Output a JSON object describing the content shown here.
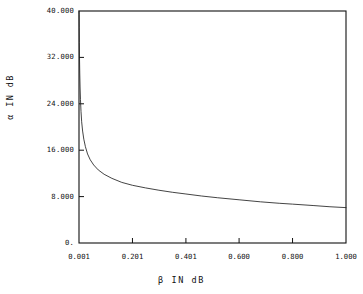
{
  "chart_data": {
    "type": "line",
    "title": "",
    "xlabel": "β  IN  dB",
    "ylabel": "α  IN  dB",
    "xlim": [
      0.001,
      1.0
    ],
    "ylim": [
      0.0,
      40.0
    ],
    "grid": false,
    "legend": null,
    "x_tick_labels": [
      "0.001",
      "0.201",
      "0.401",
      "0.600",
      "0.800",
      "1.000"
    ],
    "x_tick_values": [
      0.001,
      0.201,
      0.401,
      0.6,
      0.8,
      1.0
    ],
    "y_tick_labels": [
      "0.",
      "8.000",
      "16.000",
      "24.000",
      "32.000",
      "40.000"
    ],
    "y_tick_values": [
      0.0,
      8.0,
      16.0,
      24.0,
      32.0,
      40.0
    ],
    "series": [
      {
        "name": "alpha vs beta",
        "x": [
          0.001,
          0.0013,
          0.0017,
          0.0022,
          0.0029,
          0.0038,
          0.005,
          0.0065,
          0.0085,
          0.011,
          0.0145,
          0.019,
          0.025,
          0.033,
          0.043,
          0.056,
          0.073,
          0.095,
          0.124,
          0.161,
          0.201,
          0.25,
          0.3,
          0.35,
          0.401,
          0.46,
          0.52,
          0.6,
          0.68,
          0.75,
          0.8,
          0.88,
          0.94,
          1.0
        ],
        "y": [
          40.0,
          39.4,
          37.2,
          34.6,
          31.9,
          29.3,
          26.9,
          24.7,
          22.7,
          20.9,
          19.3,
          17.9,
          16.6,
          15.35,
          14.35,
          13.45,
          12.6,
          11.85,
          11.15,
          10.45,
          9.95,
          9.5,
          9.1,
          8.75,
          8.45,
          8.1,
          7.8,
          7.45,
          7.1,
          6.85,
          6.7,
          6.45,
          6.25,
          6.1
        ]
      }
    ],
    "plot_box_px": {
      "left": 79,
      "right": 346,
      "top": 11,
      "bottom": 243
    },
    "colors": {
      "line": "#222222",
      "axis": "#111111",
      "background": "#ffffff"
    }
  }
}
